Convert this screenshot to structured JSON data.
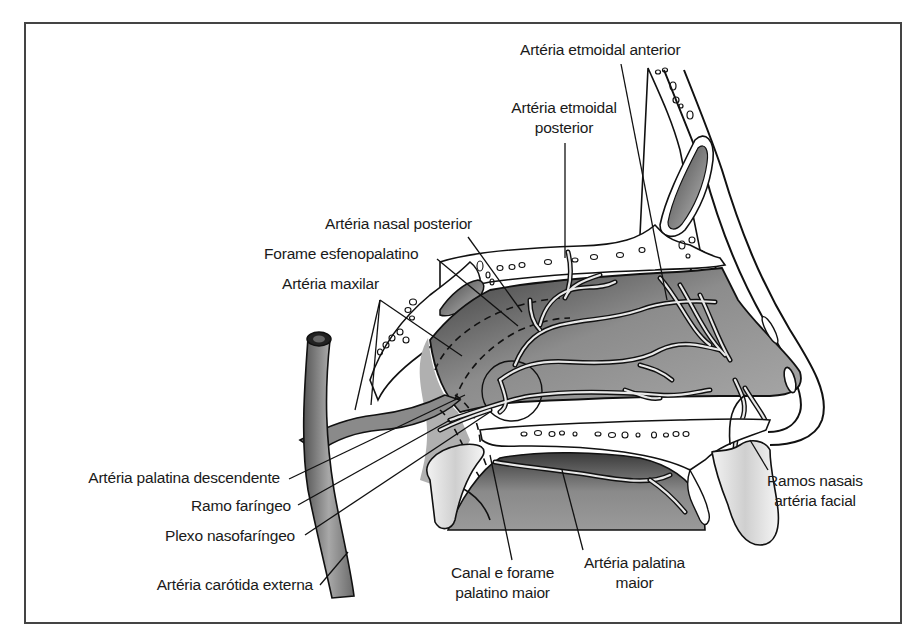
{
  "figure": {
    "type": "anatomical-diagram",
    "colors": {
      "frame": "#444444",
      "cavity_fill_dark": "#4a4a4a",
      "cavity_fill_light": "#b8b8b8",
      "bone": "#ffffff",
      "vessel_fill": "#8a8a8a",
      "outline": "#111111",
      "cartilage": "#d8d8d8"
    }
  },
  "labels": {
    "etmoidal_anterior": "Artéria etmoidal anterior",
    "etmoidal_posterior_1": "Artéria etmoidal",
    "etmoidal_posterior_2": "posterior",
    "nasal_posterior": "Artéria nasal posterior",
    "forame_esfenopalatino": "Forame esfenopalatino",
    "maxilar": "Artéria maxilar",
    "palatina_descendente": "Artéria palatina descendente",
    "ramo_faringeo": "Ramo faríngeo",
    "plexo_nasofaringeo": "Plexo nasofaríngeo",
    "carotida_externa": "Artéria carótida externa",
    "canal_forame_1": "Canal e forame",
    "canal_forame_2": "palatino maior",
    "palatina_maior_1": "Artéria palatina",
    "palatina_maior_2": "maior",
    "ramos_nasais_1": "Ramos nasais",
    "ramos_nasais_2": "artéria facial"
  }
}
